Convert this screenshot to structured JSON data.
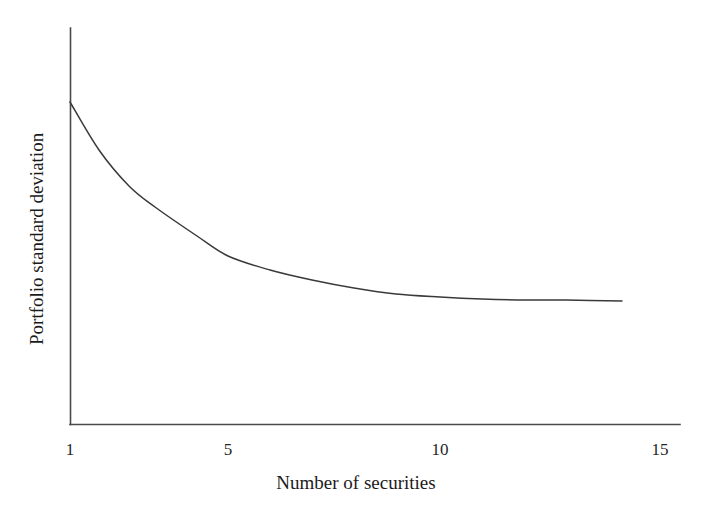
{
  "figure": {
    "background_color": "#ffffff",
    "ink_color": "#2b2b2b"
  },
  "axes": {
    "x_title": "Number of securities",
    "y_title": "Portfolio standard deviation",
    "x_ticks": [
      "1",
      "5",
      "10",
      "15"
    ],
    "y_ticks": []
  },
  "chart_data": {
    "type": "line",
    "title": "",
    "subtitle": "",
    "xlabel": "Number of securities",
    "ylabel": "Portfolio standard deviation",
    "xlim": [
      1,
      15
    ],
    "ylim": [
      0,
      1
    ],
    "grid": false,
    "legend": null,
    "x_tick_labels": [
      "1",
      "5",
      "10",
      "15"
    ],
    "x_tick_values": [
      1,
      5,
      10,
      15
    ],
    "y_tick_labels": [],
    "annotations": [],
    "series": [
      {
        "name": "Portfolio standard deviation",
        "color": "#3a3a3a",
        "x": [
          1,
          1.7,
          2.4,
          3.0,
          4.0,
          5.0,
          6.0,
          7.0,
          8.0,
          9.0,
          10.0,
          11.0,
          12.0,
          13.0,
          14.1
        ],
        "values": [
          1.0,
          0.845,
          0.738,
          0.676,
          0.588,
          0.528,
          0.485,
          0.455,
          0.43,
          0.412,
          0.398,
          0.388,
          0.38,
          0.374,
          0.369
        ],
        "pixel_points": [
          [
            70,
            102
          ],
          [
            99,
            150
          ],
          [
            129,
            186
          ],
          [
            155,
            207
          ],
          [
            197,
            236
          ],
          [
            228,
            256
          ],
          [
            270,
            270
          ],
          [
            312,
            280
          ],
          [
            354,
            288
          ],
          [
            396,
            294
          ],
          [
            440,
            297
          ],
          [
            482,
            299
          ],
          [
            524,
            300
          ],
          [
            566,
            300
          ],
          [
            622,
            301
          ]
        ]
      }
    ]
  },
  "geometry": {
    "origin_px": [
      70,
      424
    ],
    "y_axis_top_px": 28,
    "x_axis_right_px": 680,
    "px_per_unit_x": 42.1
  }
}
